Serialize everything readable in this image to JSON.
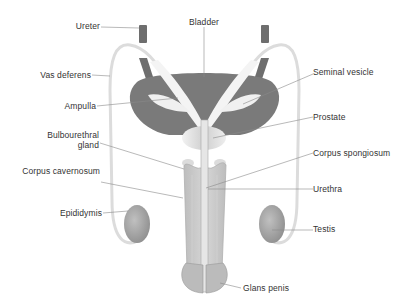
{
  "diagram": {
    "type": "anatomical illustration",
    "colors": {
      "bladder": "#7a7a7a",
      "ureter": "#6e6e6e",
      "vas_deferens_outline": "#d8d8d8",
      "gland_light": "#d0d0d0",
      "penis_body": "#c4c4c4",
      "testis": "#a8a8a8",
      "leader_line": "#888888",
      "label_text": "#333333"
    },
    "labels": {
      "ureter": "Ureter",
      "bladder": "Bladder",
      "vas_deferens": "Vas deferens",
      "seminal_vesicle": "Seminal vesicle",
      "ampulla": "Ampulla",
      "prostate": "Prostate",
      "bulbourethral_line1": "Bulbourethral",
      "bulbourethral_line2": "gland",
      "corpus_spongiosum": "Corpus spongiosum",
      "corpus_cavernosum": "Corpus cavernosum",
      "urethra": "Urethra",
      "epididymis": "Epididymis",
      "testis": "Testis",
      "glans_penis": "Glans penis"
    }
  }
}
